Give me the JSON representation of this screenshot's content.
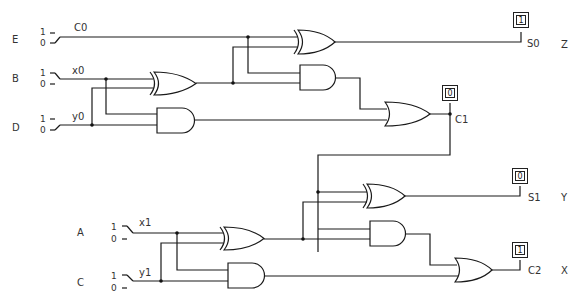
{
  "diagram": {
    "type": "two-bit binary adder logic circuit",
    "inputs": [
      {
        "id": "E",
        "label": "E",
        "signal": "C0",
        "switch_hi": "1",
        "switch_lo": "0"
      },
      {
        "id": "B",
        "label": "B",
        "signal": "x0",
        "switch_hi": "1",
        "switch_lo": "0"
      },
      {
        "id": "D",
        "label": "D",
        "signal": "y0",
        "switch_hi": "1",
        "switch_lo": "0"
      },
      {
        "id": "A",
        "label": "A",
        "signal": "x1",
        "switch_hi": "1",
        "switch_lo": "0"
      },
      {
        "id": "C",
        "label": "C",
        "signal": "y1",
        "switch_hi": "1",
        "switch_lo": "0"
      }
    ],
    "outputs": [
      {
        "id": "Z",
        "label": "Z",
        "signal": "S0",
        "value": "1"
      },
      {
        "id": "C1",
        "label": "",
        "signal": "C1",
        "value": "0"
      },
      {
        "id": "Y",
        "label": "Y",
        "signal": "S1",
        "value": "0"
      },
      {
        "id": "X",
        "label": "X",
        "signal": "C2",
        "value": "1"
      }
    ],
    "gates": [
      {
        "name": "XOR",
        "inputs": [
          "x0",
          "y0"
        ]
      },
      {
        "name": "AND",
        "inputs": [
          "x0",
          "y0"
        ]
      },
      {
        "name": "XOR",
        "inputs": [
          "C0",
          "x0 xor y0"
        ],
        "output": "S0"
      },
      {
        "name": "AND",
        "inputs": [
          "C0",
          "x0 xor y0"
        ]
      },
      {
        "name": "OR",
        "output": "C1"
      },
      {
        "name": "XOR",
        "inputs": [
          "x1",
          "y1"
        ]
      },
      {
        "name": "AND",
        "inputs": [
          "x1",
          "y1"
        ]
      },
      {
        "name": "XOR",
        "inputs": [
          "C1",
          "x1 xor y1"
        ],
        "output": "S1"
      },
      {
        "name": "AND",
        "inputs": [
          "C1",
          "x1 xor y1"
        ]
      },
      {
        "name": "OR",
        "output": "C2"
      }
    ]
  }
}
